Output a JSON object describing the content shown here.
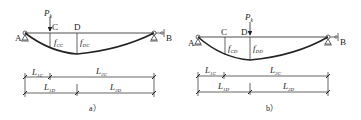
{
  "diagram": {
    "panels": [
      {
        "id": "a",
        "caption": "a）",
        "load": {
          "symbol": "P",
          "sub": "k",
          "at": "C"
        },
        "points": {
          "A": "A",
          "B": "B",
          "C": "C",
          "D": "D"
        },
        "deflections": [
          {
            "symbol": "f",
            "sub": "CC"
          },
          {
            "symbol": "f",
            "sub": "DC"
          }
        ],
        "dims": {
          "row1": [
            {
              "symbol": "L",
              "sub": "1C"
            },
            {
              "symbol": "L",
              "sub": "2C"
            }
          ],
          "row2": [
            {
              "symbol": "L",
              "sub": "1D"
            },
            {
              "symbol": "L",
              "sub": "2D"
            }
          ]
        }
      },
      {
        "id": "b",
        "caption": "b）",
        "load": {
          "symbol": "P",
          "sub": "k",
          "at": "D"
        },
        "points": {
          "A": "A",
          "B": "B",
          "C": "C",
          "D": "D"
        },
        "deflections": [
          {
            "symbol": "f",
            "sub": "CD"
          },
          {
            "symbol": "f",
            "sub": "DD"
          }
        ],
        "dims": {
          "row1": [
            {
              "symbol": "L",
              "sub": "1C"
            },
            {
              "symbol": "L",
              "sub": "2C"
            }
          ],
          "row2": [
            {
              "symbol": "L",
              "sub": "1D"
            },
            {
              "symbol": "L",
              "sub": "2D"
            }
          ]
        }
      }
    ],
    "colors": {
      "line": "#222222",
      "background": "#ffffff"
    }
  }
}
